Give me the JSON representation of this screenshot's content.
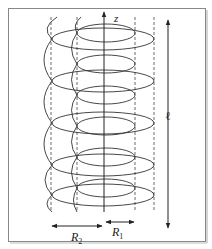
{
  "figure": {
    "labels": {
      "z_axis": "z",
      "length": "ℓ",
      "r2_main": "R",
      "r2_sub": "2",
      "r1_main": "R",
      "r1_sub": "1"
    },
    "colors": {
      "stroke": "#333333",
      "frame": "#888888",
      "background": "#ffffff"
    },
    "geometry": {
      "axis_x": 104,
      "dashed_lines_x": [
        51,
        77,
        135,
        154
      ],
      "inner_coil_radius_px": 31,
      "outer_coil_radius_px": 53,
      "turns": 5
    }
  }
}
